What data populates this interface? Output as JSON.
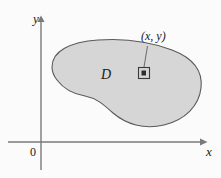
{
  "figure": {
    "type": "math-diagram",
    "background_color": "#fbfbfb",
    "axes": {
      "x_axis_label": "x",
      "y_axis_label": "y",
      "origin_label": "0",
      "axis_color": "#7a7a7a",
      "x_axis_y_position": 142,
      "y_axis_x_position": 41,
      "x_axis_start": 8,
      "x_axis_end": 204,
      "y_axis_top": 17,
      "y_axis_bottom": 170
    },
    "region": {
      "label": "D",
      "fill_color": "#d6d6d6",
      "stroke_color": "#5a5a5a",
      "outline_path": "M 52 67 C 52 50, 72 41, 99 40 C 126 39, 152 43, 172 50 C 194 58, 203 72, 201 88 C 199 105, 186 119, 166 124 C 146 129, 127 124, 114 114 C 103 106, 96 99, 86 97 C 74 95, 64 88, 57 80 C 53 75, 52 71, 52 67 Z"
    },
    "point_marker": {
      "label": "(x, y)",
      "square_x": 139,
      "square_y": 68,
      "square_size": 11,
      "square_stroke": "#3a3a3a",
      "square_fill": "#d6d6d6",
      "dot_color": "#2a2a2a",
      "leader_line": {
        "from_x": 147,
        "from_y": 47,
        "to_x": 144,
        "to_y": 71,
        "color": "#5a5a5a"
      }
    }
  }
}
